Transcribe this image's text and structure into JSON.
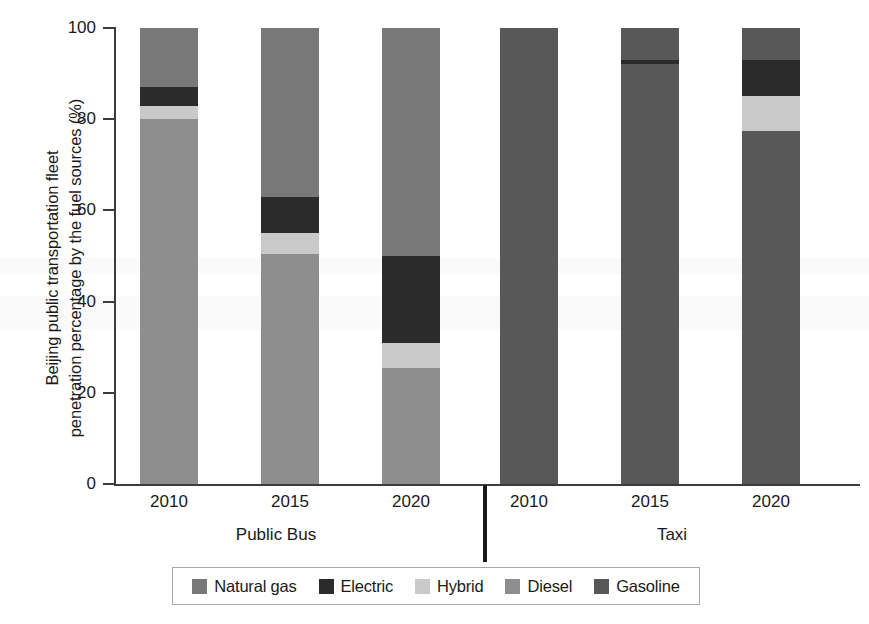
{
  "chart_data": {
    "type": "bar",
    "subtype": "stacked-bar-100-percent",
    "title": "",
    "xlabel": "",
    "ylabel": "Beijing public transportation fleet\npenetration percentage by the fuel sources (%)",
    "ylim": [
      0,
      100
    ],
    "yticks": [
      0,
      20,
      40,
      60,
      80,
      100
    ],
    "ytick_labels": [
      "0",
      "20",
      "40",
      "60",
      "80",
      "100"
    ],
    "grid": false,
    "legend_position": "bottom",
    "groups": [
      "Public Bus",
      "Taxi"
    ],
    "categories": [
      "2010",
      "2015",
      "2020",
      "2010",
      "2015",
      "2020"
    ],
    "series": [
      {
        "name": "Natural gas",
        "color": "#787878",
        "values": [
          13.0,
          37.0,
          50.0,
          0.0,
          0.0,
          0.0
        ]
      },
      {
        "name": "Electric",
        "color": "#2b2b2b",
        "values": [
          4.0,
          8.0,
          19.0,
          0.0,
          1.0,
          8.0
        ]
      },
      {
        "name": "Hybrid",
        "color": "#c9c9c9",
        "values": [
          3.0,
          4.5,
          5.5,
          0.0,
          0.0,
          7.5
        ]
      },
      {
        "name": "Diesel",
        "color": "#8e8e8e",
        "values": [
          80.0,
          50.5,
          25.5,
          0.0,
          0.0,
          0.0
        ]
      },
      {
        "name": "Gasoline",
        "color": "#585858",
        "values": [
          0.0,
          0.0,
          0.0,
          100.0,
          99.0,
          84.5
        ]
      }
    ],
    "bars": [
      {
        "group": "Public Bus",
        "year": "2010",
        "segments": [
          {
            "label": "Natural gas",
            "from": 80.0,
            "to": 100.0,
            "value": 20.0,
            "color": "#787878"
          },
          {
            "label": "Electric",
            "from": 83.0,
            "to": 87.0,
            "value": 4.0,
            "color": "#2b2b2b"
          },
          {
            "label": "Hybrid",
            "from": 80.0,
            "to": 83.0,
            "value": 3.0,
            "color": "#c9c9c9"
          },
          {
            "label": "Diesel",
            "from": 0.0,
            "to": 80.0,
            "value": 80.0,
            "color": "#8e8e8e"
          }
        ]
      },
      {
        "group": "Public Bus",
        "year": "2015",
        "segments": [
          {
            "label": "Natural gas",
            "from": 63.0,
            "to": 100.0,
            "value": 37.0,
            "color": "#787878"
          },
          {
            "label": "Electric",
            "from": 55.0,
            "to": 63.0,
            "value": 8.0,
            "color": "#2b2b2b"
          },
          {
            "label": "Hybrid",
            "from": 50.5,
            "to": 55.0,
            "value": 4.5,
            "color": "#c9c9c9"
          },
          {
            "label": "Diesel",
            "from": 0.0,
            "to": 50.5,
            "value": 50.5,
            "color": "#8e8e8e"
          }
        ]
      },
      {
        "group": "Public Bus",
        "year": "2020",
        "segments": [
          {
            "label": "Natural gas",
            "from": 50.0,
            "to": 100.0,
            "value": 50.0,
            "color": "#787878"
          },
          {
            "label": "Electric",
            "from": 31.0,
            "to": 50.0,
            "value": 19.0,
            "color": "#2b2b2b"
          },
          {
            "label": "Hybrid",
            "from": 25.5,
            "to": 31.0,
            "value": 5.5,
            "color": "#c9c9c9"
          },
          {
            "label": "Diesel",
            "from": 0.0,
            "to": 25.5,
            "value": 25.5,
            "color": "#8e8e8e"
          }
        ]
      },
      {
        "group": "Taxi",
        "year": "2010",
        "segments": [
          {
            "label": "Gasoline",
            "from": 0.0,
            "to": 100.0,
            "value": 100.0,
            "color": "#585858"
          }
        ]
      },
      {
        "group": "Taxi",
        "year": "2015",
        "segments": [
          {
            "label": "Gasoline",
            "from": 0.0,
            "to": 100.0,
            "value": 99.0,
            "color": "#585858"
          },
          {
            "label": "Electric",
            "from": 92.0,
            "to": 93.0,
            "value": 1.0,
            "color": "#2b2b2b"
          }
        ]
      },
      {
        "group": "Taxi",
        "year": "2020",
        "segments": [
          {
            "label": "Gasoline",
            "from": 93.0,
            "to": 100.0,
            "value": 7.0,
            "color": "#585858"
          },
          {
            "label": "Electric",
            "from": 85.0,
            "to": 93.0,
            "value": 8.0,
            "color": "#2b2b2b"
          },
          {
            "label": "Hybrid",
            "from": 77.5,
            "to": 85.0,
            "value": 7.5,
            "color": "#c9c9c9"
          },
          {
            "label": "Gasoline",
            "from": 0.0,
            "to": 77.5,
            "value": 77.5,
            "color": "#585858"
          }
        ]
      }
    ]
  },
  "axis": {
    "y_title": "Beijing public transportation fleet\npenetration percentage by the fuel sources (%)",
    "y_ticks": [
      "100",
      "80",
      "60",
      "40",
      "20",
      "0"
    ]
  },
  "x_labels": [
    "2010",
    "2015",
    "2020",
    "2010",
    "2015",
    "2020"
  ],
  "group_labels": [
    "Public Bus",
    "Taxi"
  ],
  "legend": {
    "items": [
      {
        "label": "Natural gas",
        "color": "#787878"
      },
      {
        "label": "Electric",
        "color": "#2b2b2b"
      },
      {
        "label": "Hybrid",
        "color": "#c9c9c9"
      },
      {
        "label": "Diesel",
        "color": "#8e8e8e"
      },
      {
        "label": "Gasoline",
        "color": "#585858"
      }
    ]
  }
}
